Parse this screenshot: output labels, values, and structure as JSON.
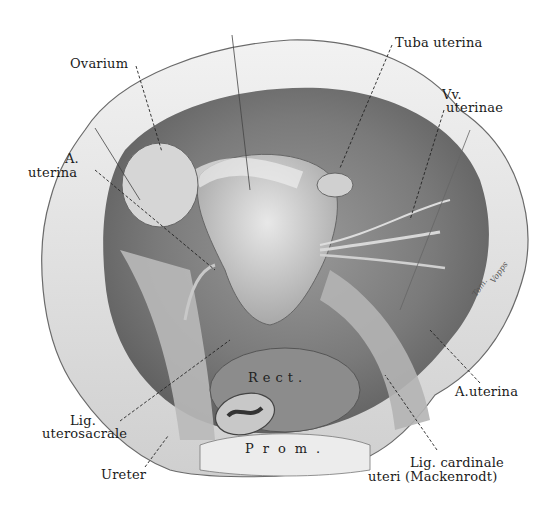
{
  "figure": {
    "type": "anatomical illustration",
    "labels": {
      "ovarium": "Ovarium",
      "tuba_uterina": "Tuba uterina",
      "vv_uterinae_1": "Vv.",
      "vv_uterinae_2": "uterinae",
      "a_uterina_left_1": "A.",
      "a_uterina_left_2": "uterina",
      "a_uterina_right": "A.uterina",
      "lig_uterosacrale_1": "Lig.",
      "lig_uterosacrale_2": "uterosacrale",
      "ureter": "Ureter",
      "lig_cardinale_1": "Lig. cardinale",
      "lig_cardinale_2": "uteri (Mackenrodt)",
      "rect": "Rect.",
      "prom": "Prom."
    },
    "signature_1": "Tom.",
    "signature_2": "Vopps"
  }
}
